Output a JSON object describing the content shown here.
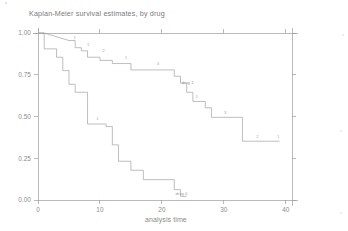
{
  "chart_data": {
    "type": "line",
    "title": "Kaplan-Meier survival estimates, by drug",
    "xlabel": "analysis time",
    "ylabel": "",
    "xlim": [
      0,
      41
    ],
    "ylim": [
      0,
      1.0
    ],
    "xticks": [
      0,
      10,
      20,
      30,
      40
    ],
    "xtick_labels": [
      "0",
      "10",
      "20",
      "30",
      "40"
    ],
    "yticks": [
      0.0,
      0.25,
      0.5,
      0.75,
      1.0
    ],
    "ytick_labels": [
      "0.00",
      "0.25",
      "0.50",
      "0.75",
      "1.00"
    ],
    "grid": false,
    "legend": "inline-curve-labels",
    "step_type": "post",
    "series": [
      {
        "name": "drug 1",
        "label": "drug 1",
        "label_x": 23.2,
        "label_y": 0.695,
        "points": [
          [
            0,
            1.0
          ],
          [
            1,
            1.0
          ],
          [
            5,
            0.955
          ],
          [
            6,
            0.955
          ],
          [
            6,
            0.912
          ],
          [
            7,
            0.912
          ],
          [
            7,
            0.893
          ],
          [
            8,
            0.893
          ],
          [
            8,
            0.855
          ],
          [
            10,
            0.855
          ],
          [
            10,
            0.836
          ],
          [
            12,
            0.836
          ],
          [
            12,
            0.817
          ],
          [
            15,
            0.817
          ],
          [
            15,
            0.779
          ],
          [
            22,
            0.779
          ],
          [
            22,
            0.741
          ],
          [
            23,
            0.741
          ],
          [
            23,
            0.7
          ],
          [
            24,
            0.7
          ],
          [
            24,
            0.645
          ],
          [
            25,
            0.645
          ],
          [
            25,
            0.59
          ],
          [
            27,
            0.59
          ],
          [
            27,
            0.552
          ],
          [
            28,
            0.552
          ],
          [
            28,
            0.495
          ],
          [
            33,
            0.495
          ],
          [
            33,
            0.352
          ],
          [
            39,
            0.352
          ]
        ],
        "risk_annotations": [
          {
            "x": 5.9,
            "y": 0.965,
            "text": "1"
          },
          {
            "x": 8.1,
            "y": 0.922,
            "text": "1"
          },
          {
            "x": 10.6,
            "y": 0.884,
            "text": "2"
          },
          {
            "x": 14.2,
            "y": 0.846,
            "text": "1"
          },
          {
            "x": 19.4,
            "y": 0.808,
            "text": "4"
          },
          {
            "x": 25.6,
            "y": 0.608,
            "text": "1"
          },
          {
            "x": 30.2,
            "y": 0.512,
            "text": "3"
          },
          {
            "x": 35.4,
            "y": 0.37,
            "text": "2"
          },
          {
            "x": 38.8,
            "y": 0.37,
            "text": "1"
          }
        ]
      },
      {
        "name": "drug 0",
        "label": "drug 0",
        "label_x": 22.2,
        "label_y": 0.03,
        "points": [
          [
            0,
            1.0
          ],
          [
            1,
            1.0
          ],
          [
            1,
            0.905
          ],
          [
            3,
            0.905
          ],
          [
            3,
            0.855
          ],
          [
            4,
            0.855
          ],
          [
            4,
            0.775
          ],
          [
            5,
            0.775
          ],
          [
            5,
            0.693
          ],
          [
            6,
            0.693
          ],
          [
            6,
            0.645
          ],
          [
            8,
            0.645
          ],
          [
            8,
            0.597
          ],
          [
            8,
            0.597
          ],
          [
            8,
            0.455
          ],
          [
            11,
            0.455
          ],
          [
            11,
            0.44
          ],
          [
            12,
            0.44
          ],
          [
            12,
            0.33
          ],
          [
            13,
            0.33
          ],
          [
            13,
            0.232
          ],
          [
            15,
            0.232
          ],
          [
            15,
            0.178
          ],
          [
            17,
            0.178
          ],
          [
            17,
            0.122
          ],
          [
            22,
            0.122
          ],
          [
            22,
            0.062
          ],
          [
            23,
            0.062
          ],
          [
            23,
            0.022
          ],
          [
            24,
            0.022
          ]
        ],
        "risk_annotations": [
          {
            "x": 9.6,
            "y": 0.478,
            "text": "1"
          }
        ]
      }
    ]
  },
  "colors": {
    "curve": "#9a9a9a",
    "axis": "#9d9d9d",
    "text": "#8a8a8a",
    "background": "#ffffff"
  }
}
